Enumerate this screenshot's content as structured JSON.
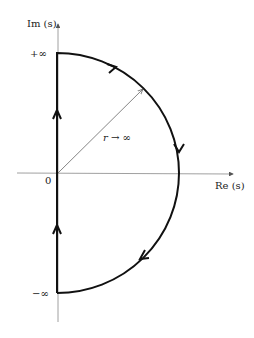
{
  "diagram": {
    "axes": {
      "imag_label": "Im (s)",
      "real_label": "Re (s)",
      "origin_label": "0"
    },
    "contour": {
      "top_label": "+∞",
      "bottom_label": "−∞",
      "radius_label": "r → ∞",
      "direction": "clockwise"
    },
    "colors": {
      "contour": "#111111",
      "axes": "#777777",
      "text": "#222222"
    }
  }
}
